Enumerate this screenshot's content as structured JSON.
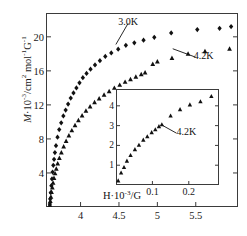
{
  "chart_data": {
    "type": "scatter",
    "title": "",
    "xlabel": "",
    "ylabel": "M·10⁻³/cm² mol⁻¹G⁻¹",
    "ylabel_parts": {
      "symbol": "M",
      "factor": "·10",
      "factor_exp": "-3",
      "unit_num": "/cm",
      "unit_num_exp": "2",
      "unit_mol": " mol",
      "unit_mol_exp": "-1",
      "unit_g": "G",
      "unit_g_exp": "-1"
    },
    "xlim": [
      3.55,
      6.05
    ],
    "ylim": [
      0,
      22.8
    ],
    "xticks": [
      4,
      4.5,
      5,
      5.5
    ],
    "xtick_labels": [
      "4",
      "4.5",
      "5",
      "5.5"
    ],
    "yticks": [
      4,
      8,
      12,
      16,
      20
    ],
    "ytick_labels": [
      "4",
      "8",
      "12",
      "16",
      "20"
    ],
    "grid": false,
    "legend": "annotations",
    "annotations": [
      {
        "text": "3.0K",
        "x": 4.62,
        "y": 21.6,
        "points_to_x": 4.46,
        "points_to_y": 19.1
      },
      {
        "text": "4.2K",
        "x": 5.5,
        "y": 17.6,
        "points_to_x": 5.2,
        "points_to_y": 18.6
      }
    ],
    "series": [
      {
        "name": "3.0K",
        "marker": "diamond",
        "color": "#111111",
        "points": [
          [
            3.6,
            0.35
          ],
          [
            3.605,
            0.95
          ],
          [
            3.612,
            1.7
          ],
          [
            3.62,
            2.5
          ],
          [
            3.628,
            3.3
          ],
          [
            3.636,
            4.1
          ],
          [
            3.645,
            4.9
          ],
          [
            3.655,
            5.6
          ],
          [
            3.666,
            6.4
          ],
          [
            3.68,
            7.2
          ],
          [
            3.7,
            8.2
          ],
          [
            3.722,
            9.1
          ],
          [
            3.748,
            9.9
          ],
          [
            3.776,
            10.7
          ],
          [
            3.806,
            11.4
          ],
          [
            3.838,
            12.1
          ],
          [
            3.872,
            12.8
          ],
          [
            3.908,
            13.4
          ],
          [
            3.946,
            14.0
          ],
          [
            3.986,
            14.6
          ],
          [
            4.03,
            15.2
          ],
          [
            4.078,
            15.7
          ],
          [
            4.13,
            16.2
          ],
          [
            4.188,
            16.7
          ],
          [
            4.252,
            17.2
          ],
          [
            4.322,
            17.7
          ],
          [
            4.4,
            18.1
          ],
          [
            4.49,
            18.55
          ],
          [
            4.59,
            19.0
          ],
          [
            4.7,
            19.3
          ],
          [
            4.82,
            19.6
          ],
          [
            4.96,
            19.95
          ],
          [
            5.18,
            20.45
          ],
          [
            5.52,
            20.85
          ],
          [
            5.81,
            21.0
          ],
          [
            5.96,
            21.2
          ]
        ]
      },
      {
        "name": "4.2K",
        "marker": "triangle",
        "color": "#111111",
        "points": [
          [
            3.6,
            0.25
          ],
          [
            3.606,
            0.7
          ],
          [
            3.614,
            1.2
          ],
          [
            3.622,
            1.75
          ],
          [
            3.632,
            2.3
          ],
          [
            3.642,
            2.85
          ],
          [
            3.654,
            3.4
          ],
          [
            3.668,
            3.95
          ],
          [
            3.684,
            4.5
          ],
          [
            3.702,
            5.1
          ],
          [
            3.724,
            5.75
          ],
          [
            3.75,
            6.4
          ],
          [
            3.78,
            7.1
          ],
          [
            3.812,
            7.75
          ],
          [
            3.848,
            8.4
          ],
          [
            3.886,
            9.0
          ],
          [
            3.928,
            9.6
          ],
          [
            3.972,
            10.2
          ],
          [
            4.02,
            10.75
          ],
          [
            4.07,
            11.3
          ],
          [
            4.124,
            11.8
          ],
          [
            4.182,
            12.3
          ],
          [
            4.242,
            12.75
          ],
          [
            4.306,
            13.2
          ],
          [
            4.372,
            13.6
          ],
          [
            4.44,
            14.0
          ],
          [
            4.51,
            14.35
          ],
          [
            4.58,
            14.7
          ],
          [
            4.65,
            15.0
          ],
          [
            4.72,
            15.3
          ],
          [
            4.79,
            15.6
          ],
          [
            4.84,
            15.8
          ],
          [
            4.94,
            16.8
          ],
          [
            5.0,
            17.1
          ],
          [
            5.19,
            17.5
          ],
          [
            5.4,
            18.0
          ],
          [
            5.62,
            18.3
          ],
          [
            5.94,
            18.6
          ]
        ]
      }
    ],
    "inset": {
      "type": "scatter",
      "xlabel": "H·10⁻³/G",
      "xlabel_parts": {
        "symbol": "H",
        "factor": "·10",
        "factor_exp": "-3",
        "unit": "/G"
      },
      "ylabel": "",
      "xlim": [
        0.0,
        0.283
      ],
      "ylim": [
        0,
        4.85
      ],
      "xticks": [
        0.1,
        0.2
      ],
      "xtick_labels": [
        "0.1",
        "0.2"
      ],
      "yticks": [
        1,
        2,
        3,
        4
      ],
      "ytick_labels": [
        "1",
        "2",
        "3",
        "4"
      ],
      "grid": false,
      "annotations": [
        {
          "text": "4.2K",
          "x": 0.166,
          "y": 2.62,
          "points_to_x": 0.124,
          "points_to_y": 3.05
        }
      ],
      "series": [
        {
          "name": "4.2K",
          "marker": "triangle",
          "color": "#111111",
          "points": [
            [
              0.006,
              0.22
            ],
            [
              0.014,
              0.62
            ],
            [
              0.022,
              0.9
            ],
            [
              0.03,
              1.22
            ],
            [
              0.04,
              1.5
            ],
            [
              0.052,
              1.8
            ],
            [
              0.063,
              2.02
            ],
            [
              0.075,
              2.28
            ],
            [
              0.086,
              2.45
            ],
            [
              0.098,
              2.66
            ],
            [
              0.108,
              2.8
            ],
            [
              0.118,
              2.96
            ],
            [
              0.126,
              3.06
            ],
            [
              0.15,
              3.5
            ],
            [
              0.176,
              3.82
            ],
            [
              0.203,
              4.06
            ],
            [
              0.232,
              4.22
            ],
            [
              0.262,
              4.48
            ]
          ]
        }
      ]
    }
  },
  "axis_labels": {
    "main_y": "M·10⁻³/cm² mol⁻¹G⁻¹",
    "inset_x": "H·10⁻³/G"
  }
}
